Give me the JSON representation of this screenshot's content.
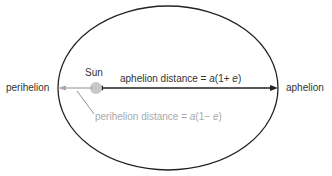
{
  "diagram": {
    "type": "elliptical orbit",
    "labels": {
      "sun": "Sun",
      "perihelion": "perihelion",
      "aphelion": "aphelion",
      "aphelion_distance_prefix": "aphelion distance = ",
      "aphelion_distance_a": "a",
      "aphelion_distance_mid": "(1+ ",
      "aphelion_distance_e": "e",
      "aphelion_distance_suffix": ")",
      "perihelion_distance_prefix": "perihelion distance = ",
      "perihelion_distance_a": "a",
      "perihelion_distance_mid": "(1− ",
      "perihelion_distance_e": "e",
      "perihelion_distance_suffix": ")"
    },
    "colors": {
      "orbit": "#222222",
      "aphelion_arrow": "#222222",
      "perihelion_arrow": "#a9a9a9",
      "sun": "#c8c8c8",
      "text_dark": "#333333",
      "text_grey": "#a9a9a9"
    }
  }
}
